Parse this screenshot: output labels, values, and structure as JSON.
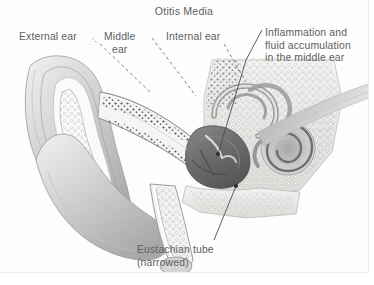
{
  "figure": {
    "title": "Otitis Media",
    "background_color": "#ffffff",
    "panel_color": "#fdfdfd",
    "text_color": "#5d6064",
    "style": "grayscale anatomical cross-section illustration of the human ear"
  },
  "labels": {
    "external_ear": "External ear",
    "middle_ear": "Middle\near",
    "internal_ear": "Internal ear",
    "inflammation": "Inflammation and\nfluid accumulation\nin the middle ear",
    "eustachian": "Eustachian tube\n(narrowed)"
  },
  "structures": [
    {
      "name": "pinna",
      "label": "External ear"
    },
    {
      "name": "ear-canal",
      "label": "External ear"
    },
    {
      "name": "earlobe",
      "label": "External ear"
    },
    {
      "name": "tympanic-membrane",
      "label": "Middle ear"
    },
    {
      "name": "middle-ear-cavity",
      "label": "Inflammation and fluid accumulation in the middle ear"
    },
    {
      "name": "ossicles",
      "label": "Middle ear"
    },
    {
      "name": "eustachian-tube",
      "label": "Eustachian tube (narrowed)"
    },
    {
      "name": "cochlea",
      "label": "Internal ear"
    },
    {
      "name": "semicircular-canals",
      "label": "Internal ear"
    },
    {
      "name": "auditory-nerve",
      "label": "Internal ear"
    }
  ]
}
